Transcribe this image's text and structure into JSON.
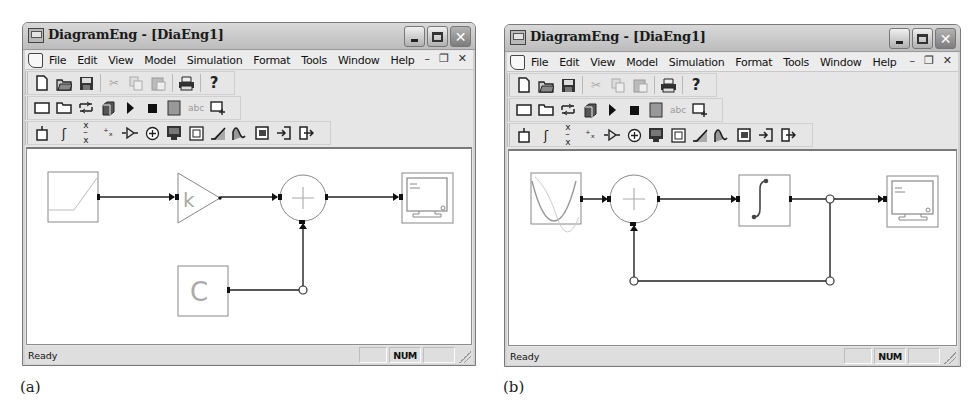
{
  "figures": [
    {
      "id": "a",
      "caption": "(a)",
      "window": {
        "title": "DiagramEng - [DiaEng1]",
        "controls": {
          "minimize": "minimize-icon",
          "maximize": "maximize-icon",
          "close": "close-icon"
        },
        "menu": [
          "File",
          "Edit",
          "View",
          "Model",
          "Simulation",
          "Format",
          "Tools",
          "Window",
          "Help"
        ],
        "mdi_controls": [
          "_",
          "̸",
          "×"
        ],
        "toolbars": {
          "standard": [
            "new",
            "open",
            "save",
            "cut",
            "copy",
            "paste",
            "print",
            "about"
          ],
          "common_ops": [
            "select-all",
            "open-folder",
            "auto-fit",
            "build-subsystem",
            "start",
            "stop",
            "numerical-solver",
            "show-annotation",
            "add-multiple-blocks"
          ],
          "blocks": [
            "constant",
            "integrator",
            "divide",
            "gain-x",
            "gain-triangle",
            "sum",
            "output",
            "constant-c",
            "linear-function",
            "signal-generator",
            "subsystem",
            "subsystem-in",
            "subsystem-out"
          ]
        },
        "diagram": {
          "blocks": [
            "linear-function",
            "gain-k",
            "sum",
            "output-display",
            "constant-c"
          ],
          "gain_label": "k",
          "constant_label": "C",
          "sum_label": "+"
        },
        "status": {
          "text": "Ready",
          "panes": [
            "",
            "NUM",
            ""
          ]
        }
      }
    },
    {
      "id": "b",
      "caption": "(b)",
      "window": {
        "title": "DiagramEng - [DiaEng1]",
        "controls": {
          "minimize": "minimize-icon",
          "maximize": "maximize-icon",
          "close": "close-icon"
        },
        "menu": [
          "File",
          "Edit",
          "View",
          "Model",
          "Simulation",
          "Format",
          "Tools",
          "Window",
          "Help"
        ],
        "mdi_controls": [
          "_",
          "̸",
          "×"
        ],
        "toolbars": {
          "standard": [
            "new",
            "open",
            "save",
            "cut",
            "copy",
            "paste",
            "print",
            "about"
          ],
          "common_ops": [
            "select-all",
            "open-folder",
            "auto-fit",
            "build-subsystem",
            "start",
            "stop",
            "numerical-solver",
            "show-annotation",
            "add-multiple-blocks"
          ],
          "blocks": [
            "constant",
            "integrator",
            "divide",
            "gain-x",
            "gain-triangle",
            "sum",
            "output",
            "constant-c",
            "linear-function",
            "signal-generator",
            "subsystem",
            "subsystem-in",
            "subsystem-out"
          ]
        },
        "diagram": {
          "blocks": [
            "signal-generator",
            "sum",
            "integrator",
            "output-display"
          ],
          "sum_label": "+",
          "feedback_loop": true
        },
        "status": {
          "text": "Ready",
          "panes": [
            "",
            "NUM",
            ""
          ]
        }
      }
    }
  ]
}
